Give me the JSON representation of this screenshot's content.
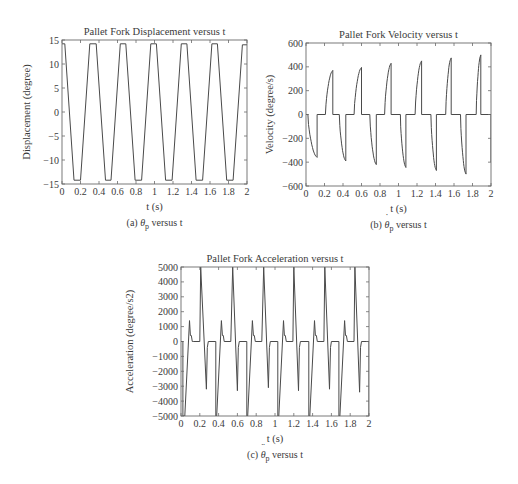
{
  "figure": {
    "panels": [
      {
        "id": "a",
        "caption_prefix": "(a) ",
        "caption_symbol": "θ",
        "caption_sub": "p",
        "caption_accent": "",
        "caption_suffix": " versus t"
      },
      {
        "id": "b",
        "caption_prefix": "(b) ",
        "caption_symbol": "θ",
        "caption_sub": "p",
        "caption_accent": "˙",
        "caption_suffix": " versus t"
      },
      {
        "id": "c",
        "caption_prefix": "(c) ",
        "caption_symbol": "θ",
        "caption_sub": "p",
        "caption_accent": "¨",
        "caption_suffix": " versus t"
      }
    ],
    "colors": {
      "line": "#4a4a4a",
      "axes": "#6a6a6a",
      "text": "#3a3a3a"
    }
  },
  "chart_data": [
    {
      "type": "line",
      "title": "Pallet Fork Displacement versus t",
      "xlabel": "t (s)",
      "ylabel": "Displacement (degree)",
      "xlim": [
        0,
        2
      ],
      "ylim": [
        -15,
        15
      ],
      "xticks": [
        0,
        0.2,
        0.4,
        0.6,
        0.8,
        1,
        1.2,
        1.4,
        1.6,
        1.8,
        2
      ],
      "xtick_labels": [
        "0",
        "0.2",
        "0.4",
        "0.6",
        "0.8",
        "1",
        "1.2",
        "1.4",
        "1.6",
        "1.8",
        "2"
      ],
      "yticks": [
        15,
        10,
        5,
        0,
        -5,
        -10,
        -15
      ],
      "ytick_labels": [
        "15",
        "10",
        "5",
        "0",
        "−5",
        "−10",
        "−15"
      ],
      "grid": false,
      "series": [
        {
          "name": "displacement",
          "x": [
            0,
            0.03,
            0.13,
            0.2,
            0.3,
            0.37,
            0.47,
            0.53,
            0.63,
            0.69,
            0.79,
            0.86,
            0.96,
            1.02,
            1.12,
            1.19,
            1.29,
            1.35,
            1.45,
            1.52,
            1.62,
            1.68,
            1.78,
            1.85,
            1.95,
            2.0
          ],
          "y": [
            14.2,
            14.2,
            -14.2,
            -14.2,
            14.2,
            14.2,
            -14.2,
            -14.2,
            14.2,
            14.2,
            -14.2,
            -14.2,
            14.2,
            14.2,
            -14.2,
            -14.2,
            14.2,
            14.2,
            -14.2,
            -14.2,
            14.2,
            14.2,
            -14.2,
            -14.2,
            14.0,
            14.0
          ]
        }
      ]
    },
    {
      "type": "line",
      "title": "Pallet Fork Velocity versus t",
      "xlabel": "t (s)",
      "ylabel": "Velocity (degree/s)",
      "xlim": [
        0,
        2
      ],
      "ylim": [
        -600,
        600
      ],
      "xticks": [
        0,
        0.2,
        0.4,
        0.6,
        0.8,
        1,
        1.2,
        1.4,
        1.6,
        1.8,
        2
      ],
      "xtick_labels": [
        "0",
        "0.2",
        "0.4",
        "0.6",
        "0.8",
        "1",
        "1.2",
        "1.4",
        "1.6",
        "1.8",
        "2"
      ],
      "yticks": [
        600,
        400,
        200,
        0,
        -200,
        -400,
        -600
      ],
      "ytick_labels": [
        "600",
        "400",
        "200",
        "0",
        "−200",
        "−400",
        "−600"
      ],
      "grid": false,
      "pulses": [
        {
          "sign": -1,
          "start": 0.02,
          "end": 0.12,
          "peak": -360
        },
        {
          "sign": 1,
          "start": 0.21,
          "end": 0.29,
          "peak": 370
        },
        {
          "sign": -1,
          "start": 0.36,
          "end": 0.43,
          "peak": -390
        },
        {
          "sign": 1,
          "start": 0.52,
          "end": 0.6,
          "peak": 395
        },
        {
          "sign": -1,
          "start": 0.69,
          "end": 0.76,
          "peak": -420
        },
        {
          "sign": 1,
          "start": 0.85,
          "end": 0.92,
          "peak": 430
        },
        {
          "sign": -1,
          "start": 1.02,
          "end": 1.08,
          "peak": -445
        },
        {
          "sign": 1,
          "start": 1.18,
          "end": 1.25,
          "peak": 450
        },
        {
          "sign": -1,
          "start": 1.35,
          "end": 1.41,
          "peak": -470
        },
        {
          "sign": 1,
          "start": 1.51,
          "end": 1.57,
          "peak": 475
        },
        {
          "sign": -1,
          "start": 1.67,
          "end": 1.73,
          "peak": -500
        },
        {
          "sign": 1,
          "start": 1.84,
          "end": 1.89,
          "peak": 500
        }
      ]
    },
    {
      "type": "line",
      "title": "Pallet Fork Acceleration versus t",
      "xlabel": "t (s)",
      "ylabel": "Acceleration (degree/s2)",
      "xlim": [
        0,
        2
      ],
      "ylim": [
        -5000,
        5000
      ],
      "xticks": [
        0,
        0.2,
        0.4,
        0.6,
        0.8,
        1,
        1.2,
        1.4,
        1.6,
        1.8,
        2
      ],
      "xtick_labels": [
        "0",
        "0.2",
        "0.4",
        "0.6",
        "0.8",
        "1",
        "1.2",
        "1.4",
        "1.6",
        "1.8",
        "2"
      ],
      "yticks": [
        5000,
        4000,
        3000,
        2000,
        1000,
        0,
        -1000,
        -2000,
        -3000,
        -4000,
        -5000
      ],
      "ytick_labels": [
        "5000",
        "4000",
        "3000",
        "2000",
        "1000",
        "0",
        "−1000",
        "−2000",
        "−3000",
        "−4000",
        "−5000"
      ],
      "grid": false,
      "series": [
        {
          "name": "acceleration",
          "x": [
            0,
            0.02,
            0.02,
            0.04,
            0.09,
            0.1,
            0.11,
            0.12,
            0.13,
            0.2,
            0.21,
            0.21,
            0.27,
            0.28,
            0.29,
            0.37,
            0.37,
            0.38,
            0.43,
            0.44,
            0.45,
            0.46,
            0.53,
            0.55,
            0.55,
            0.6,
            0.61,
            0.62,
            0.7,
            0.7,
            0.71,
            0.76,
            0.77,
            0.78,
            0.79,
            0.86,
            0.88,
            0.88,
            0.93,
            0.94,
            0.95,
            1.03,
            1.03,
            1.04,
            1.09,
            1.1,
            1.11,
            1.12,
            1.19,
            1.2,
            1.2,
            1.25,
            1.26,
            1.27,
            1.36,
            1.36,
            1.37,
            1.42,
            1.43,
            1.44,
            1.45,
            1.52,
            1.53,
            1.53,
            1.58,
            1.59,
            1.6,
            1.68,
            1.68,
            1.69,
            1.74,
            1.75,
            1.76,
            1.77,
            1.84,
            1.85,
            1.85,
            1.9,
            1.91,
            1.92,
            2.0,
            2.0
          ],
          "y": [
            0,
            0,
            -5000,
            -5000,
            1400,
            400,
            400,
            0,
            0,
            0,
            5000,
            5000,
            -3200,
            -400,
            0,
            0,
            -5000,
            -5000,
            1400,
            400,
            400,
            0,
            0,
            5000,
            5000,
            -3300,
            -400,
            0,
            0,
            -5000,
            -5000,
            1400,
            400,
            400,
            0,
            0,
            5000,
            5000,
            -3100,
            -400,
            0,
            0,
            -5000,
            -5000,
            1400,
            400,
            400,
            0,
            0,
            5000,
            5000,
            -3300,
            -400,
            0,
            0,
            -5000,
            -5000,
            1400,
            400,
            400,
            0,
            0,
            5000,
            5000,
            -3200,
            -400,
            0,
            0,
            -5000,
            -5000,
            1400,
            400,
            400,
            0,
            0,
            5000,
            5000,
            -3400,
            -400,
            0,
            0,
            -5000
          ]
        }
      ]
    }
  ]
}
